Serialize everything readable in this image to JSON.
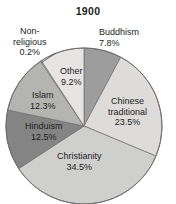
{
  "chart_data": {
    "type": "pie",
    "title": "1900",
    "xlabel": "",
    "ylabel": "",
    "legend": "none",
    "grid": false,
    "unit": "%",
    "start_angle_deg": 0,
    "direction": "clockwise",
    "categories": [
      "Buddhism",
      "Chinese traditional",
      "Christianity",
      "Hinduism",
      "Islam",
      "Non-religious",
      "Other"
    ],
    "values": [
      7.8,
      23.5,
      34.5,
      12.5,
      12.3,
      0.2,
      9.2
    ],
    "slices": [
      {
        "label": "Buddhism",
        "label_line1": "Buddhism",
        "label_line2": "7.8%",
        "value": 7.8,
        "value_text": "7.8%",
        "color": "#9d9d9d"
      },
      {
        "label": "Chinese traditional",
        "label_line1": "Chinese",
        "label_line2": "traditional",
        "label_line3": "23.5%",
        "value": 23.5,
        "value_text": "23.5%",
        "color": "#dddcda"
      },
      {
        "label": "Christianity",
        "label_line1": "Christianity",
        "label_line2": "34.5%",
        "value": 34.5,
        "value_text": "34.5%",
        "color": "#cfcfcd"
      },
      {
        "label": "Hinduism",
        "label_line1": "Hinduism",
        "label_line2": "12.5%",
        "value": 12.5,
        "value_text": "12.5%",
        "color": "#848484"
      },
      {
        "label": "Islam",
        "label_line1": "Islam",
        "label_line2": "12.3%",
        "value": 12.3,
        "value_text": "12.3%",
        "color": "#b4b4b2"
      },
      {
        "label": "Non-religious",
        "label_line1": "Non-",
        "label_line2": "religious",
        "label_line3": "0.2%",
        "value": 0.2,
        "value_text": "0.2%",
        "color": "#efefee"
      },
      {
        "label": "Other",
        "label_line1": "Other",
        "label_line2": "9.2%",
        "value": 9.2,
        "value_text": "9.2%",
        "color": "#e6e5e3"
      }
    ]
  }
}
